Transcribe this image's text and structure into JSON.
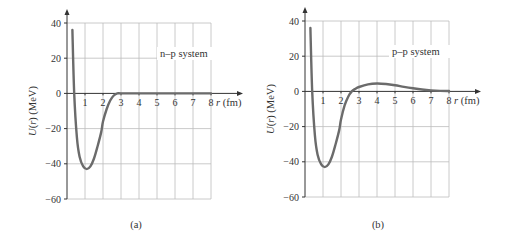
{
  "chart_data": [
    {
      "type": "line",
      "panel_label": "(a)",
      "annotation": "n–p system",
      "xlabel": "r (fm)",
      "ylabel": "U(r) (MeV)",
      "x_ticks": [
        "1",
        "2",
        "3",
        "4",
        "5",
        "6",
        "7",
        "8"
      ],
      "y_ticks": [
        "40",
        "20",
        "0",
        "-20",
        "-40",
        "-60"
      ],
      "xlim": [
        0,
        8
      ],
      "ylim": [
        -60,
        40
      ],
      "grid": true,
      "series": [
        {
          "name": "U(r) n-p",
          "x": [
            0.3,
            0.4,
            0.55,
            0.7,
            0.9,
            1.1,
            1.3,
            1.5,
            1.7,
            1.9,
            2.0,
            2.2,
            2.4,
            2.6,
            2.8,
            3.0,
            4.0,
            5.0,
            6.0,
            7.0,
            8.0
          ],
          "y": [
            36,
            0,
            -25,
            -36,
            -41.5,
            -43,
            -41.5,
            -37,
            -30,
            -22,
            -16,
            -9,
            -4,
            -1.2,
            0,
            0,
            0,
            0,
            0,
            0,
            0
          ]
        }
      ]
    },
    {
      "type": "line",
      "panel_label": "(b)",
      "annotation": "p–p system",
      "xlabel": "r (fm)",
      "ylabel": "U(r) (MeV)",
      "x_ticks": [
        "1",
        "2",
        "3",
        "4",
        "5",
        "6",
        "7",
        "8"
      ],
      "y_ticks": [
        "40",
        "20",
        "0",
        "-20",
        "-40",
        "-60"
      ],
      "xlim": [
        0,
        8
      ],
      "ylim": [
        -60,
        40
      ],
      "grid": true,
      "series": [
        {
          "name": "U(r) p-p",
          "x": [
            0.3,
            0.4,
            0.55,
            0.7,
            0.9,
            1.1,
            1.3,
            1.5,
            1.7,
            1.9,
            2.0,
            2.2,
            2.4,
            2.6,
            2.8,
            3.0,
            3.5,
            4.0,
            4.5,
            5.0,
            5.5,
            6.0,
            6.5,
            7.0,
            7.5,
            8.0
          ],
          "y": [
            36,
            0,
            -25,
            -36,
            -41.5,
            -43,
            -41.5,
            -37,
            -30,
            -22,
            -16,
            -8,
            -3,
            0,
            1.5,
            2.5,
            4,
            4.5,
            4.2,
            3.5,
            2.6,
            1.8,
            1.1,
            0.6,
            0.3,
            0.2
          ]
        }
      ]
    }
  ],
  "panels": [
    {
      "label": "(a)",
      "annotation": "n–p system",
      "xaxis_label": "r (fm)",
      "yaxis_label": "U(r) (MeV)"
    },
    {
      "label": "(b)",
      "annotation": "p–p system",
      "xaxis_label": "r (fm)",
      "yaxis_label": "U(r) (MeV)"
    }
  ],
  "colors": {
    "curve": "#6b6b6b",
    "grid": "#bdbdbd",
    "axis": "#333333"
  }
}
